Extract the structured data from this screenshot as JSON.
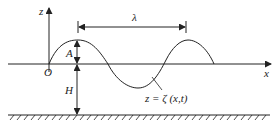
{
  "diagram": {
    "labels": {
      "z_axis": "z",
      "x_axis": "x",
      "origin": "O",
      "wavelength": "λ",
      "amplitude": "A",
      "depth": "H",
      "surface_eq": "z = ζ (x,t)"
    },
    "colors": {
      "stroke": "#222222",
      "background": "#ffffff"
    }
  }
}
